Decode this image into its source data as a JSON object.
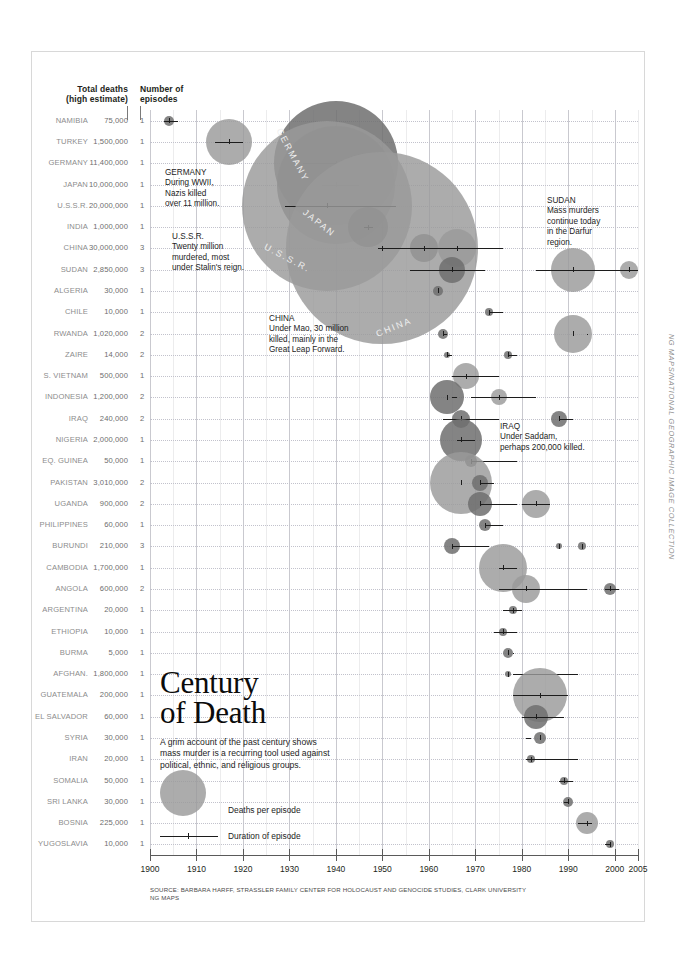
{
  "header": {
    "deaths_label": "Total deaths\n(high estimate)",
    "deaths_label_line1": "Total deaths",
    "deaths_label_line2": "(high estimate)",
    "episodes_label_line1": "Number of",
    "episodes_label_line2": "episodes"
  },
  "title": {
    "line1": "Century",
    "line2": "of Death",
    "subtitle": "A grim account of the past century shows mass murder is a recurring tool used against political, ethnic, and religious groups."
  },
  "legend": {
    "bubble_label": "Deaths per episode",
    "duration_label": "Duration of episode"
  },
  "source": {
    "line1": "SOURCE: BARBARA HARFF, STRASSLER FAMILY CENTER FOR HOLOCAUST AND GENOCIDE STUDIES, CLARK UNIVERSITY",
    "line2": "NG MAPS"
  },
  "credit": "NG MAPS/NATIONAL GEOGRAPHIC IMAGE COLLECTION",
  "callouts": [
    {
      "name": "germany",
      "title": "GERMANY",
      "body": "During WWII,\nNazis killed\nover 11 million.",
      "x": 165,
      "y": 168
    },
    {
      "name": "ussr",
      "title": "U.S.S.R.",
      "body": "Twenty million\nmurdered, most\nunder Stalin's reign.",
      "x": 172,
      "y": 232
    },
    {
      "name": "china",
      "title": "CHINA",
      "body": "Under Mao, 30 million\nkilled, mainly in the\nGreat Leap Forward.",
      "x": 269,
      "y": 314
    },
    {
      "name": "sudan",
      "title": "SUDAN",
      "body": "Mass murders\ncontinue today\nin the Darfur\nregion.",
      "x": 547,
      "y": 196
    },
    {
      "name": "iraq",
      "title": "IRAQ",
      "body": "Under Saddam,\nperhaps 200,000 killed.",
      "x": 500,
      "y": 422
    }
  ],
  "bubble_labels": [
    {
      "text": "GERMANY",
      "x": 263,
      "y": 150,
      "rotate": 62
    },
    {
      "text": "JAPAN",
      "x": 300,
      "y": 218,
      "rotate": 38
    },
    {
      "text": "U.S.S.R.",
      "x": 262,
      "y": 253,
      "rotate": 28
    },
    {
      "text": "CHINA",
      "x": 375,
      "y": 322,
      "rotate": -22
    }
  ],
  "chart_data": {
    "type": "scatter",
    "title": "Century of Death",
    "xlabel": "",
    "ylabel": "",
    "xlim": [
      1900,
      2005
    ],
    "grid": true,
    "legend_position": "lower-left",
    "x_ticks": [
      1900,
      1910,
      1920,
      1930,
      1940,
      1950,
      1960,
      1970,
      1980,
      1990,
      2000,
      2005
    ],
    "columns": [
      "Country",
      "Total deaths (high estimate)",
      "Number of episodes"
    ],
    "rows": [
      {
        "country": "NAMIBIA",
        "deaths": "75,000",
        "deaths_value": 75000,
        "episodes": "1",
        "episodes_value": 1,
        "marks": [
          {
            "center": 1904,
            "r": 5,
            "start": 1903,
            "end": 1906,
            "dark": true
          }
        ]
      },
      {
        "country": "TURKEY",
        "deaths": "1,500,000",
        "deaths_value": 1500000,
        "episodes": "1",
        "episodes_value": 1,
        "marks": [
          {
            "center": 1917,
            "r": 23,
            "start": 1914,
            "end": 1920,
            "dark": false
          }
        ]
      },
      {
        "country": "GERMANY",
        "deaths": "11,400,000",
        "deaths_value": 11400000,
        "episodes": "1",
        "episodes_value": 1,
        "marks": [
          {
            "center": 1940,
            "r": 62,
            "start": 1933,
            "end": 1945,
            "dark": true
          }
        ]
      },
      {
        "country": "JAPAN",
        "deaths": "10,000,000",
        "deaths_value": 10000000,
        "episodes": "1",
        "episodes_value": 1,
        "marks": [
          {
            "center": 1940,
            "r": 59,
            "start": 1937,
            "end": 1945,
            "dark": true
          }
        ]
      },
      {
        "country": "U.S.S.R.",
        "deaths": "20,000,000",
        "deaths_value": 20000000,
        "episodes": "1",
        "episodes_value": 1,
        "marks": [
          {
            "center": 1938,
            "r": 85,
            "start": 1929,
            "end": 1953,
            "dark": false
          }
        ]
      },
      {
        "country": "INDIA",
        "deaths": "1,000,000",
        "deaths_value": 1000000,
        "episodes": "1",
        "episodes_value": 1,
        "marks": [
          {
            "center": 1947,
            "r": 20,
            "start": 1946,
            "end": 1948,
            "dark": true
          }
        ]
      },
      {
        "country": "CHINA",
        "deaths": "30,000,000",
        "deaths_value": 30000000,
        "episodes": "3",
        "episodes_value": 3,
        "marks": [
          {
            "center": 1959,
            "r": 14,
            "start": 1958,
            "end": 1962,
            "dark": true
          },
          {
            "center": 1966,
            "r": 19,
            "start": 1962,
            "end": 1971,
            "dark": false
          },
          {
            "center": 1950,
            "r": 96,
            "start": 1949,
            "end": 1976,
            "dark": false
          }
        ]
      },
      {
        "country": "SUDAN",
        "deaths": "2,850,000",
        "deaths_value": 2850000,
        "episodes": "3",
        "episodes_value": 3,
        "marks": [
          {
            "center": 1965,
            "r": 13,
            "start": 1956,
            "end": 1972,
            "dark": true
          },
          {
            "center": 1991,
            "r": 22,
            "start": 1983,
            "end": 2005,
            "dark": false
          },
          {
            "center": 2003,
            "r": 9,
            "start": 2003,
            "end": 2005,
            "dark": false
          }
        ]
      },
      {
        "country": "ALGERIA",
        "deaths": "30,000",
        "deaths_value": 30000,
        "episodes": "1",
        "episodes_value": 1,
        "marks": [
          {
            "center": 1962,
            "r": 5,
            "start": 1962,
            "end": 1962,
            "dark": true
          }
        ]
      },
      {
        "country": "CHILE",
        "deaths": "10,000",
        "deaths_value": 10000,
        "episodes": "1",
        "episodes_value": 1,
        "marks": [
          {
            "center": 1973,
            "r": 4,
            "start": 1973,
            "end": 1976,
            "dark": true
          }
        ]
      },
      {
        "country": "RWANDA",
        "deaths": "1,020,000",
        "deaths_value": 1020000,
        "episodes": "2",
        "episodes_value": 2,
        "marks": [
          {
            "center": 1963,
            "r": 5,
            "start": 1963,
            "end": 1964,
            "dark": true
          },
          {
            "center": 1991,
            "r": 19,
            "start": 1994,
            "end": 1994,
            "dark": false
          }
        ]
      },
      {
        "country": "ZAIRE",
        "deaths": "14,000",
        "deaths_value": 14000,
        "episodes": "2",
        "episodes_value": 2,
        "marks": [
          {
            "center": 1964,
            "r": 3,
            "start": 1964,
            "end": 1965,
            "dark": true
          },
          {
            "center": 1977,
            "r": 4,
            "start": 1977,
            "end": 1979,
            "dark": true
          }
        ]
      },
      {
        "country": "S. VIETNAM",
        "deaths": "500,000",
        "deaths_value": 500000,
        "episodes": "1",
        "episodes_value": 1,
        "marks": [
          {
            "center": 1968,
            "r": 13,
            "start": 1965,
            "end": 1975,
            "dark": false
          }
        ]
      },
      {
        "country": "INDONESIA",
        "deaths": "1,200,000",
        "deaths_value": 1200000,
        "episodes": "2",
        "episodes_value": 2,
        "marks": [
          {
            "center": 1964,
            "r": 17,
            "start": 1965,
            "end": 1966,
            "dark": true
          },
          {
            "center": 1975,
            "r": 8,
            "start": 1969,
            "end": 1983,
            "dark": false
          }
        ]
      },
      {
        "country": "IRAQ",
        "deaths": "240,000",
        "deaths_value": 240000,
        "episodes": "2",
        "episodes_value": 2,
        "marks": [
          {
            "center": 1967,
            "r": 9,
            "start": 1963,
            "end": 1975,
            "dark": true
          },
          {
            "center": 1988,
            "r": 8,
            "start": 1988,
            "end": 1991,
            "dark": true
          }
        ]
      },
      {
        "country": "NIGERIA",
        "deaths": "2,000,000",
        "deaths_value": 2000000,
        "episodes": "1",
        "episodes_value": 1,
        "marks": [
          {
            "center": 1967,
            "r": 21,
            "start": 1966,
            "end": 1970,
            "dark": true
          }
        ]
      },
      {
        "country": "EQ. GUINEA",
        "deaths": "50,000",
        "deaths_value": 50000,
        "episodes": "1",
        "episodes_value": 1,
        "marks": [
          {
            "center": 1969,
            "r": 6,
            "start": 1969,
            "end": 1979,
            "dark": true
          }
        ]
      },
      {
        "country": "PAKISTAN",
        "deaths": "3,010,000",
        "deaths_value": 3010000,
        "episodes": "2",
        "episodes_value": 2,
        "marks": [
          {
            "center": 1967,
            "r": 31,
            "start": 1971,
            "end": 1974,
            "dark": false
          },
          {
            "center": 1971,
            "r": 8,
            "start": 1971,
            "end": 1971,
            "dark": true
          }
        ]
      },
      {
        "country": "UGANDA",
        "deaths": "900,000",
        "deaths_value": 900000,
        "episodes": "2",
        "episodes_value": 2,
        "marks": [
          {
            "center": 1971,
            "r": 12,
            "start": 1971,
            "end": 1979,
            "dark": true
          },
          {
            "center": 1983,
            "r": 14,
            "start": 1980,
            "end": 1986,
            "dark": false
          }
        ]
      },
      {
        "country": "PHILIPPINES",
        "deaths": "60,000",
        "deaths_value": 60000,
        "episodes": "1",
        "episodes_value": 1,
        "marks": [
          {
            "center": 1972,
            "r": 6,
            "start": 1972,
            "end": 1976,
            "dark": true
          }
        ]
      },
      {
        "country": "BURUNDI",
        "deaths": "210,000",
        "deaths_value": 210000,
        "episodes": "3",
        "episodes_value": 3,
        "marks": [
          {
            "center": 1965,
            "r": 8,
            "start": 1965,
            "end": 1973,
            "dark": true
          },
          {
            "center": 1988,
            "r": 3,
            "start": 1988,
            "end": 1988,
            "dark": true
          },
          {
            "center": 1993,
            "r": 4,
            "start": 1993,
            "end": 1993,
            "dark": true
          }
        ]
      },
      {
        "country": "CAMBODIA",
        "deaths": "1,700,000",
        "deaths_value": 1700000,
        "episodes": "1",
        "episodes_value": 1,
        "marks": [
          {
            "center": 1976,
            "r": 24,
            "start": 1975,
            "end": 1979,
            "dark": false
          }
        ]
      },
      {
        "country": "ANGOLA",
        "deaths": "600,000",
        "deaths_value": 600000,
        "episodes": "2",
        "episodes_value": 2,
        "marks": [
          {
            "center": 1981,
            "r": 14,
            "start": 1975,
            "end": 1994,
            "dark": false
          },
          {
            "center": 1999,
            "r": 6,
            "start": 1998,
            "end": 2001,
            "dark": true
          }
        ]
      },
      {
        "country": "ARGENTINA",
        "deaths": "20,000",
        "deaths_value": 20000,
        "episodes": "1",
        "episodes_value": 1,
        "marks": [
          {
            "center": 1978,
            "r": 4,
            "start": 1976,
            "end": 1980,
            "dark": true
          }
        ]
      },
      {
        "country": "ETHIOPIA",
        "deaths": "10,000",
        "deaths_value": 10000,
        "episodes": "1",
        "episodes_value": 1,
        "marks": [
          {
            "center": 1976,
            "r": 4,
            "start": 1974,
            "end": 1979,
            "dark": true
          }
        ]
      },
      {
        "country": "BURMA",
        "deaths": "5,000",
        "deaths_value": 5000,
        "episodes": "1",
        "episodes_value": 1,
        "marks": [
          {
            "center": 1977,
            "r": 5,
            "start": 1978,
            "end": 1978,
            "dark": true
          }
        ]
      },
      {
        "country": "AFGHAN.",
        "deaths": "1,800,000",
        "deaths_value": 1800000,
        "episodes": "1",
        "episodes_value": 1,
        "marks": [
          {
            "center": 1977,
            "r": 3,
            "start": 1978,
            "end": 1992,
            "dark": true
          }
        ]
      },
      {
        "country": "GUATEMALA",
        "deaths": "200,000",
        "deaths_value": 200000,
        "episodes": "1",
        "episodes_value": 1,
        "marks": [
          {
            "center": 1984,
            "r": 27,
            "start": 1978,
            "end": 1990,
            "dark": false
          }
        ]
      },
      {
        "country": "EL SALVADOR",
        "deaths": "60,000",
        "deaths_value": 60000,
        "episodes": "1",
        "episodes_value": 1,
        "marks": [
          {
            "center": 1983,
            "r": 12,
            "start": 1980,
            "end": 1989,
            "dark": true
          }
        ]
      },
      {
        "country": "SYRIA",
        "deaths": "30,000",
        "deaths_value": 30000,
        "episodes": "1",
        "episodes_value": 1,
        "marks": [
          {
            "center": 1984,
            "r": 6,
            "start": 1981,
            "end": 1982,
            "dark": true
          }
        ]
      },
      {
        "country": "IRAN",
        "deaths": "20,000",
        "deaths_value": 20000,
        "episodes": "1",
        "episodes_value": 1,
        "marks": [
          {
            "center": 1982,
            "r": 4,
            "start": 1981,
            "end": 1992,
            "dark": true
          }
        ]
      },
      {
        "country": "SOMALIA",
        "deaths": "50,000",
        "deaths_value": 50000,
        "episodes": "1",
        "episodes_value": 1,
        "marks": [
          {
            "center": 1989,
            "r": 4,
            "start": 1988,
            "end": 1991,
            "dark": true
          }
        ]
      },
      {
        "country": "SRI LANKA",
        "deaths": "30,000",
        "deaths_value": 30000,
        "episodes": "1",
        "episodes_value": 1,
        "marks": [
          {
            "center": 1990,
            "r": 5,
            "start": 1989,
            "end": 1990,
            "dark": true
          }
        ]
      },
      {
        "country": "BOSNIA",
        "deaths": "225,000",
        "deaths_value": 225000,
        "episodes": "1",
        "episodes_value": 1,
        "marks": [
          {
            "center": 1994,
            "r": 11,
            "start": 1992,
            "end": 1995,
            "dark": false
          }
        ]
      },
      {
        "country": "YUGOSLAVIA",
        "deaths": "10,000",
        "deaths_value": 10000,
        "episodes": "1",
        "episodes_value": 1,
        "marks": [
          {
            "center": 1999,
            "r": 4,
            "start": 1998,
            "end": 1999,
            "dark": true
          }
        ]
      }
    ]
  }
}
